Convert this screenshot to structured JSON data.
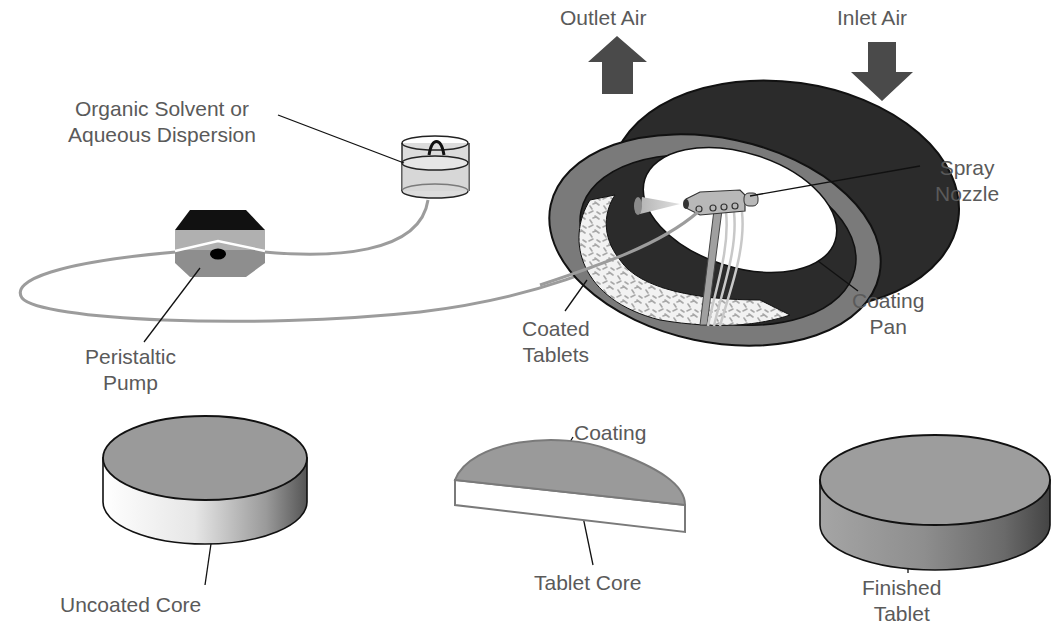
{
  "diagram": {
    "type": "pan-coating-process",
    "labels": {
      "solvent": [
        "Organic Solvent or",
        "Aqueous Dispersion"
      ],
      "pump": [
        "Peristaltic",
        "Pump"
      ],
      "outlet_air": "Outlet Air",
      "inlet_air": "Inlet Air",
      "spray_nozzle": [
        "Spray",
        "Nozzle"
      ],
      "coating_pan": [
        "Coating",
        "Pan"
      ],
      "coated_tablets": [
        "Coated",
        "Tablets"
      ],
      "coating": "Coating",
      "tablet_core": "Tablet Core",
      "uncoated_core": "Uncoated Core",
      "finished_tablet": [
        "Finished",
        "Tablet"
      ]
    },
    "colors": {
      "text": "#5a5a5a",
      "arrow": "#4a4a4a",
      "pan_outer": "#2b2b2b",
      "pan_rim": "#7a7a7a",
      "tablet_face": "#9a9a9a",
      "tube": "#9c9c9c",
      "outline": "#111111"
    }
  }
}
